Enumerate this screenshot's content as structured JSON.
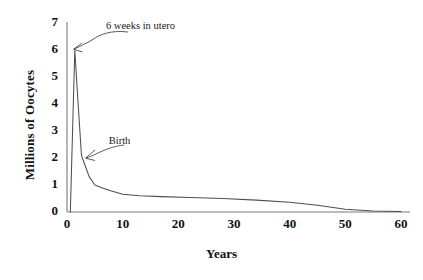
{
  "chart_data": {
    "type": "line",
    "title": "",
    "xlabel": "Years",
    "ylabel": "Millions of Oocytes",
    "xlim": [
      0,
      60
    ],
    "ylim": [
      0,
      7
    ],
    "xticks": [
      "0",
      "10",
      "20",
      "30",
      "40",
      "50",
      "60"
    ],
    "xtick_values": [
      0,
      10,
      20,
      30,
      40,
      50,
      60
    ],
    "yticks": [
      "0",
      "1",
      "2",
      "3",
      "4",
      "5",
      "6",
      "7"
    ],
    "ytick_values": [
      0,
      1,
      2,
      3,
      4,
      5,
      6,
      7
    ],
    "grid": false,
    "legend": false,
    "series": [
      {
        "name": "Oocyte number",
        "x": [
          0.6,
          1.4,
          2.0,
          2.6,
          3.2,
          4.0,
          5.0,
          6.5,
          8.0,
          10.0,
          13.0,
          17.0,
          22.0,
          28.0,
          34.0,
          40.0,
          45.0,
          50.0,
          55.0,
          60.0
        ],
        "values": [
          0.0,
          6.0,
          4.0,
          2.1,
          1.75,
          1.3,
          1.0,
          0.88,
          0.78,
          0.66,
          0.6,
          0.57,
          0.54,
          0.5,
          0.44,
          0.36,
          0.25,
          0.1,
          0.04,
          0.02
        ]
      }
    ],
    "annotations": [
      {
        "text": "6 weeks in utero",
        "label_x": 7.0,
        "label_y": 6.85,
        "point_x": 1.5,
        "point_y": 5.9
      },
      {
        "text": "Birth",
        "label_x": 7.5,
        "label_y": 2.6,
        "point_x": 2.6,
        "point_y": 2.1
      }
    ]
  },
  "axis_color": "#6b6b6b",
  "line_color": "#4a4a4a",
  "text_color": "#111111"
}
